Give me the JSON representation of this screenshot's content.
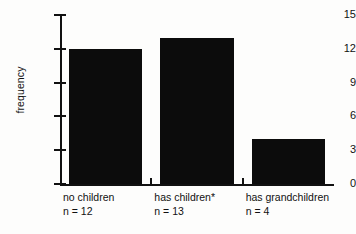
{
  "chart_data": {
    "type": "bar",
    "title": "",
    "xlabel": "",
    "ylabel": "frequency",
    "categories": [
      "no children",
      "has children*",
      "has grandchildren"
    ],
    "category_notes": [
      "n = 12",
      "n = 13",
      "n = 4"
    ],
    "values": [
      12,
      13,
      4
    ],
    "ylim": [
      0,
      15
    ],
    "yticks": [
      0,
      3,
      6,
      9,
      12,
      15
    ],
    "ytick_labels": [
      "0",
      "3",
      "6",
      "9",
      "12",
      "15"
    ],
    "grid": false,
    "legend": "none",
    "bar_color": "#0c0c0c",
    "axis_color": "#111111",
    "background_color": "#fdfdfc",
    "annotations": [
      "* footnote marker on 'has children'"
    ]
  },
  "axis": {
    "y_label": "frequency"
  }
}
